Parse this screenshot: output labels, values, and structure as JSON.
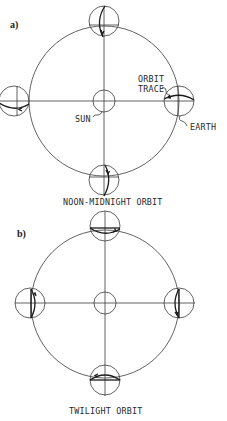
{
  "panel_a": {
    "label": "a)",
    "caption": "NOON-MIDNIGHT ORBIT",
    "annotations": {
      "sun": "SUN",
      "orbit_trace_line1": "ORBIT",
      "orbit_trace_line2": "TRACE",
      "earth": "EARTH"
    }
  },
  "panel_b": {
    "label": "b)",
    "caption": "TWILIGHT ORBIT"
  }
}
